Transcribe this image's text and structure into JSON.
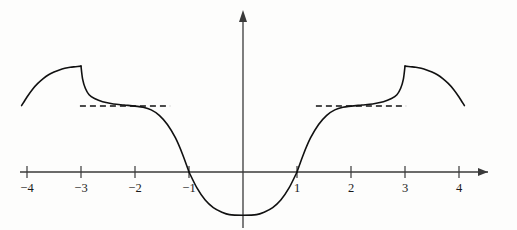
{
  "figure": {
    "title": "",
    "background_color": "#fdfdfc",
    "curve_color": "#111111",
    "axis_color": "#3a3a3a",
    "asymptote_color": "#111111",
    "asymptote_style": "dashed"
  },
  "axes": {
    "x_label": "",
    "y_label": "",
    "x_axis_pixel_y": 172,
    "y_axis_pixel_x": 243,
    "unit_pixels": 54,
    "x_ticks": [
      {
        "value": -4,
        "label": "−4",
        "px": 25
      },
      {
        "value": -3,
        "label": "−3",
        "px": 79
      },
      {
        "value": -2,
        "label": "−2",
        "px": 133
      },
      {
        "value": -1,
        "label": "−1",
        "px": 187
      },
      {
        "value": 1,
        "label": "1",
        "px": 295
      },
      {
        "value": 2,
        "label": "2",
        "px": 349
      },
      {
        "value": 3,
        "label": "3",
        "px": 403
      },
      {
        "value": 4,
        "label": "4",
        "px": 457
      }
    ],
    "y_ticks": [],
    "x_arrow": true,
    "y_arrow": true,
    "grid": false
  },
  "chart_data": {
    "type": "line",
    "title": "",
    "xlabel": "",
    "ylabel": "",
    "xlim": [
      -4.3,
      4.6
    ],
    "ylim": [
      -0.85,
      2.1
    ],
    "grid": false,
    "legend": "none",
    "series": [
      {
        "name": "branch-left-outer",
        "x_domain": [
          -4.1,
          -3.0
        ],
        "points": [
          [
            -4.1,
            1.23
          ],
          [
            -4.0,
            1.39
          ],
          [
            -3.9,
            1.53
          ],
          [
            -3.8,
            1.64
          ],
          [
            -3.7,
            1.73
          ],
          [
            -3.6,
            1.8
          ],
          [
            -3.5,
            1.85
          ],
          [
            -3.4,
            1.89
          ],
          [
            -3.3,
            1.92
          ],
          [
            -3.2,
            1.94
          ],
          [
            -3.1,
            1.95
          ],
          [
            -3.0,
            1.96
          ]
        ]
      },
      {
        "name": "branch-left-inner",
        "x_domain": [
          -3.0,
          -1.0
        ],
        "points": [
          [
            -3.0,
            1.96
          ],
          [
            -2.97,
            1.72
          ],
          [
            -2.92,
            1.55
          ],
          [
            -2.85,
            1.43
          ],
          [
            -2.75,
            1.36
          ],
          [
            -2.6,
            1.3
          ],
          [
            -2.4,
            1.26
          ],
          [
            -2.2,
            1.24
          ],
          [
            -2.0,
            1.22
          ],
          [
            -1.85,
            1.2
          ],
          [
            -1.7,
            1.15
          ],
          [
            -1.55,
            1.05
          ],
          [
            -1.4,
            0.88
          ],
          [
            -1.25,
            0.63
          ],
          [
            -1.12,
            0.33
          ],
          [
            -1.0,
            0.0
          ]
        ]
      },
      {
        "name": "branch-center",
        "x_domain": [
          -1.0,
          1.0
        ],
        "points": [
          [
            -1.0,
            0.0
          ],
          [
            -0.85,
            -0.3
          ],
          [
            -0.7,
            -0.52
          ],
          [
            -0.55,
            -0.66
          ],
          [
            -0.4,
            -0.74
          ],
          [
            -0.25,
            -0.79
          ],
          [
            0.0,
            -0.8
          ],
          [
            0.25,
            -0.79
          ],
          [
            0.4,
            -0.74
          ],
          [
            0.55,
            -0.66
          ],
          [
            0.7,
            -0.52
          ],
          [
            0.85,
            -0.3
          ],
          [
            1.0,
            0.0
          ]
        ]
      },
      {
        "name": "branch-right-inner",
        "x_domain": [
          1.0,
          3.0
        ],
        "points": [
          [
            1.0,
            0.0
          ],
          [
            1.12,
            0.33
          ],
          [
            1.25,
            0.63
          ],
          [
            1.4,
            0.88
          ],
          [
            1.55,
            1.05
          ],
          [
            1.7,
            1.15
          ],
          [
            1.85,
            1.2
          ],
          [
            2.0,
            1.22
          ],
          [
            2.2,
            1.24
          ],
          [
            2.4,
            1.26
          ],
          [
            2.6,
            1.3
          ],
          [
            2.75,
            1.36
          ],
          [
            2.85,
            1.43
          ],
          [
            2.92,
            1.55
          ],
          [
            2.97,
            1.72
          ],
          [
            3.0,
            1.96
          ]
        ]
      },
      {
        "name": "branch-right-outer",
        "x_domain": [
          3.0,
          4.1
        ],
        "points": [
          [
            3.0,
            1.96
          ],
          [
            3.1,
            1.95
          ],
          [
            3.2,
            1.94
          ],
          [
            3.3,
            1.92
          ],
          [
            3.4,
            1.89
          ],
          [
            3.5,
            1.85
          ],
          [
            3.6,
            1.8
          ],
          [
            3.7,
            1.73
          ],
          [
            3.8,
            1.64
          ],
          [
            3.9,
            1.53
          ],
          [
            4.0,
            1.39
          ],
          [
            4.1,
            1.23
          ]
        ]
      }
    ],
    "asymptotes": [
      {
        "name": "left-plateau",
        "y": 1.22,
        "x_from": -3.02,
        "x_to": -1.35
      },
      {
        "name": "right-plateau",
        "y": 1.22,
        "x_from": 1.35,
        "x_to": 3.02
      }
    ],
    "jump_discontinuities": [
      {
        "x": -3,
        "left_limit": 1.96,
        "right_limit": 1.96,
        "note": "vertical drop drawn at x=-3"
      },
      {
        "x": 3,
        "left_limit": 1.96,
        "right_limit": 1.96,
        "note": "vertical rise drawn at x=3"
      }
    ],
    "zeros": [
      -1,
      1
    ],
    "minimum": {
      "x": 0,
      "y": -0.8
    }
  }
}
